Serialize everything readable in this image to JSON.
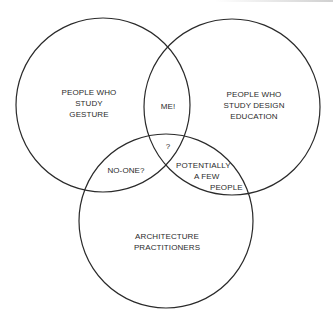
{
  "diagram": {
    "type": "venn",
    "sets": [
      {
        "id": "gesture",
        "lines": [
          "PEOPLE WHO",
          "STUDY",
          "GESTURE"
        ],
        "cx": 103,
        "cy": 105,
        "r": 87
      },
      {
        "id": "design_education",
        "lines": [
          "PEOPLE WHO",
          "STUDY DESIGN",
          "EDUCATION"
        ],
        "cx": 232,
        "cy": 107,
        "r": 88
      },
      {
        "id": "architecture",
        "lines": [
          "ARCHITECTURE",
          "PRACTITIONERS"
        ],
        "cx": 166,
        "cy": 221,
        "r": 87
      }
    ],
    "intersections": {
      "gesture_design": "ME!",
      "all_three": "?",
      "gesture_architecture": "NO-ONE?",
      "design_architecture": [
        "POTENTIALLY",
        "A FEW",
        "PEOPLE"
      ]
    },
    "stroke_color": "#2a2a2a",
    "background": "#ffffff"
  }
}
